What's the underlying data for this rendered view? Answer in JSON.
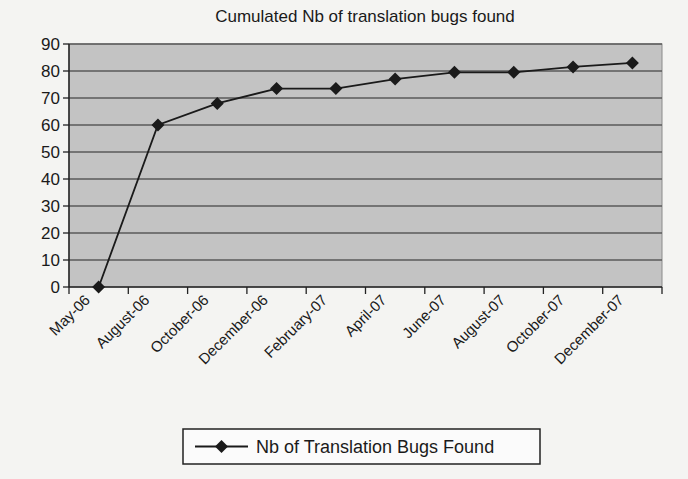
{
  "chart_data": {
    "type": "line",
    "title": "Cumulated Nb of translation bugs found",
    "xlabel": "",
    "ylabel": "",
    "ylim": [
      0,
      90
    ],
    "yticks": [
      0,
      10,
      20,
      30,
      40,
      50,
      60,
      70,
      80,
      90
    ],
    "grid": true,
    "legend_position": "bottom",
    "categories": [
      "May-06",
      "August-06",
      "October-06",
      "December-06",
      "February-07",
      "April-07",
      "June-07",
      "August-07",
      "October-07",
      "December-07"
    ],
    "series": [
      {
        "name": "Nb of Translation Bugs Found",
        "marker": "diamond",
        "values": [
          0,
          60,
          68,
          73.5,
          73.5,
          77,
          79.5,
          79.5,
          81.5,
          83
        ]
      }
    ]
  },
  "colors": {
    "plot_background": "#c3c3c3",
    "gridline": "#5a5a5a",
    "series_line": "#1a1a1a",
    "page_background": "#f4f4f2"
  }
}
